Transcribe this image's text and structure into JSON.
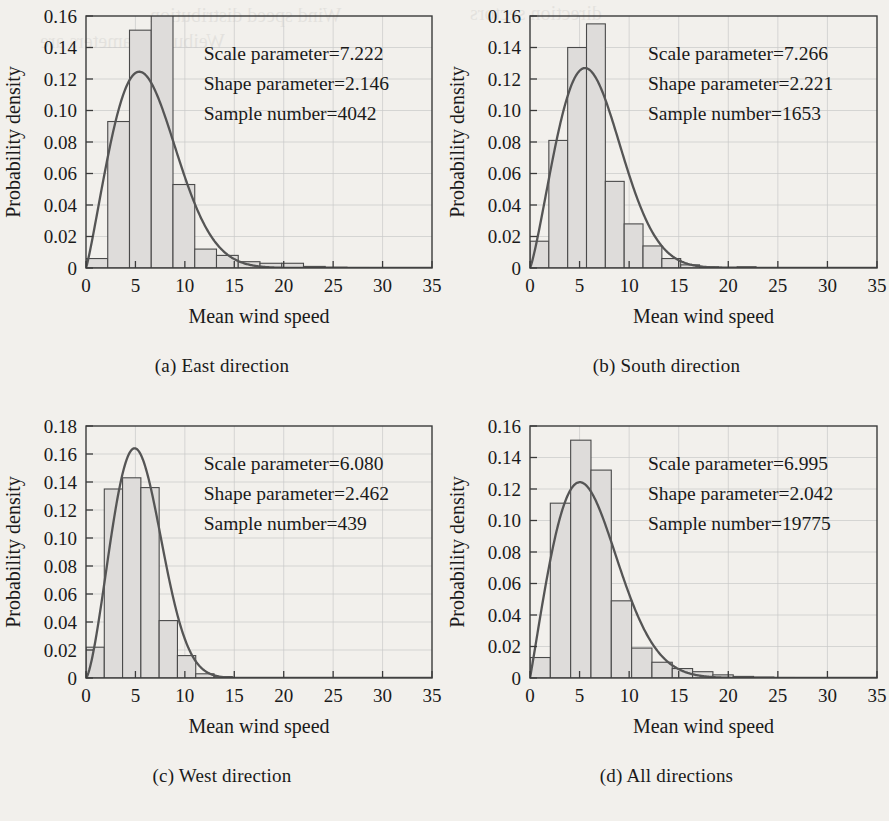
{
  "figure": {
    "background_color": "#f2f0ec",
    "bar_fill_color": "#dedcda",
    "bar_stroke_color": "#4a4a4a",
    "curve_color": "#555555",
    "axis_color": "#3b3b3b",
    "gridline_color": "#c9c9c9",
    "layout": "2x2",
    "bleed_text": [
      "Wind speed distribution",
      "direction sectors",
      "Weibull parameters are"
    ]
  },
  "panels": [
    {
      "caption": "(a) East direction",
      "annotations": [
        "Scale parameter=7.222",
        "Shape parameter=2.146",
        "Sample number=4042"
      ],
      "scale_parameter": 7.222,
      "shape_parameter": 2.146,
      "sample_number": 4042,
      "chart_data": {
        "type": "bar",
        "title": "(a) East direction",
        "xlabel": "Mean wind speed",
        "ylabel": "Probability density",
        "xlim": [
          0,
          35
        ],
        "ylim": [
          0,
          0.16
        ],
        "xticks": [
          0,
          5,
          10,
          15,
          20,
          25,
          30,
          35
        ],
        "yticks": [
          0,
          0.02,
          0.04,
          0.06,
          0.08,
          0.1,
          0.12,
          0.14,
          0.16
        ],
        "xticklabels": [
          "0",
          "5",
          "10",
          "15",
          "20",
          "25",
          "30",
          "35"
        ],
        "yticklabels": [
          "0",
          "0.02",
          "0.04",
          "0.06",
          "0.08",
          "0.10",
          "0.12",
          "0.14",
          "0.16"
        ],
        "grid": true,
        "legend": "none",
        "bin_width": 2.2,
        "bin_edges": [
          0,
          2.2,
          4.4,
          6.6,
          8.8,
          11.0,
          13.2,
          15.4,
          17.6,
          19.8,
          22.0,
          24.2,
          26.4,
          28.6,
          30.8,
          33.0
        ],
        "values": [
          0.006,
          0.093,
          0.151,
          0.168,
          0.053,
          0.012,
          0.008,
          0.004,
          0.003,
          0.003,
          0.001,
          0.0005,
          0.0003,
          0.0002,
          0.0001
        ],
        "series": [
          {
            "name": "Weibull fit",
            "type": "line",
            "peak_x": 5.9,
            "peak_y": 0.1248
          }
        ]
      }
    },
    {
      "caption": "(b) South direction",
      "annotations": [
        "Scale parameter=7.266",
        "Shape parameter=2.221",
        "Sample number=1653"
      ],
      "scale_parameter": 7.266,
      "shape_parameter": 2.221,
      "sample_number": 1653,
      "chart_data": {
        "type": "bar",
        "title": "(b) South direction",
        "xlabel": "Mean wind speed",
        "ylabel": "Probability density",
        "xlim": [
          0,
          35
        ],
        "ylim": [
          0,
          0.16
        ],
        "xticks": [
          0,
          5,
          10,
          15,
          20,
          25,
          30,
          35
        ],
        "yticks": [
          0,
          0.02,
          0.04,
          0.06,
          0.08,
          0.1,
          0.12,
          0.14,
          0.16
        ],
        "xticklabels": [
          "0",
          "5",
          "10",
          "15",
          "20",
          "25",
          "30",
          "35"
        ],
        "yticklabels": [
          "0",
          "0.02",
          "0.04",
          "0.06",
          "0.08",
          "0.10",
          "0.12",
          "0.14",
          "0.16"
        ],
        "grid": true,
        "legend": "none",
        "bin_width": 1.9,
        "bin_edges": [
          0,
          1.9,
          3.8,
          5.7,
          7.6,
          9.5,
          11.4,
          13.3,
          15.2,
          17.1,
          19.0,
          20.9,
          22.8,
          24.7,
          26.6
        ],
        "values": [
          0.017,
          0.081,
          0.14,
          0.155,
          0.055,
          0.028,
          0.014,
          0.006,
          0.002,
          0.0008,
          0.0005,
          0.0008,
          0.0003,
          0.0002
        ],
        "series": [
          {
            "name": "Weibull fit",
            "type": "line",
            "peak_x": 5.6,
            "peak_y": 0.1272
          }
        ]
      }
    },
    {
      "caption": "(c) West direction",
      "annotations": [
        "Scale parameter=6.080",
        "Shape parameter=2.462",
        "Sample number=439"
      ],
      "scale_parameter": 6.08,
      "shape_parameter": 2.462,
      "sample_number": 439,
      "chart_data": {
        "type": "bar",
        "title": "(c) West direction",
        "xlabel": "Mean wind speed",
        "ylabel": "Probability density",
        "xlim": [
          0,
          35
        ],
        "ylim": [
          0,
          0.18
        ],
        "xticks": [
          0,
          5,
          10,
          15,
          20,
          25,
          30,
          35
        ],
        "yticks": [
          0,
          0.02,
          0.04,
          0.06,
          0.08,
          0.1,
          0.12,
          0.14,
          0.16,
          0.18
        ],
        "xticklabels": [
          "0",
          "5",
          "10",
          "15",
          "20",
          "25",
          "30",
          "35"
        ],
        "yticklabels": [
          "0",
          "0.02",
          "0.04",
          "0.06",
          "0.08",
          "0.10",
          "0.12",
          "0.14",
          "0.16",
          "0.18"
        ],
        "grid": true,
        "legend": "none",
        "bin_width": 1.85,
        "bin_edges": [
          0,
          1.85,
          3.7,
          5.55,
          7.4,
          9.25,
          11.1,
          12.95,
          14.8
        ],
        "values": [
          0.022,
          0.135,
          0.143,
          0.136,
          0.041,
          0.016,
          0.003,
          0.001
        ],
        "series": [
          {
            "name": "Weibull fit",
            "type": "line",
            "peak_x": 4.7,
            "peak_y": 0.1635
          }
        ]
      }
    },
    {
      "caption": "(d) All directions",
      "annotations": [
        "Scale parameter=6.995",
        "Shape parameter=2.042",
        "Sample number=19775"
      ],
      "scale_parameter": 6.995,
      "shape_parameter": 2.042,
      "sample_number": 19775,
      "chart_data": {
        "type": "bar",
        "title": "(d) All directions",
        "xlabel": "Mean wind speed",
        "ylabel": "Probability density",
        "xlim": [
          0,
          35
        ],
        "ylim": [
          0,
          0.16
        ],
        "xticks": [
          0,
          5,
          10,
          15,
          20,
          25,
          30,
          35
        ],
        "yticks": [
          0,
          0.02,
          0.04,
          0.06,
          0.08,
          0.1,
          0.12,
          0.14,
          0.16
        ],
        "xticklabels": [
          "0",
          "5",
          "10",
          "15",
          "20",
          "25",
          "30",
          "35"
        ],
        "yticklabels": [
          "0",
          "0.02",
          "0.04",
          "0.06",
          "0.08",
          "0.10",
          "0.12",
          "0.14",
          "0.16"
        ],
        "grid": true,
        "legend": "none",
        "bin_width": 2.05,
        "bin_edges": [
          0,
          2.05,
          4.1,
          6.15,
          8.2,
          10.25,
          12.3,
          14.35,
          16.4,
          18.45,
          20.5,
          22.55,
          24.6,
          26.65,
          28.7,
          30.75
        ],
        "values": [
          0.013,
          0.111,
          0.151,
          0.132,
          0.049,
          0.019,
          0.01,
          0.006,
          0.004,
          0.002,
          0.001,
          0.0006,
          0.0003,
          0.0002,
          0.0001
        ],
        "series": [
          {
            "name": "Weibull fit",
            "type": "line",
            "peak_x": 5.1,
            "peak_y": 0.1243
          }
        ]
      }
    }
  ]
}
